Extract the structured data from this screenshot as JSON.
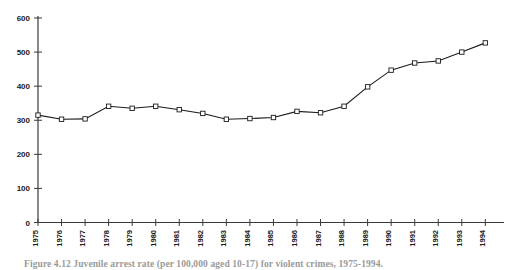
{
  "figure": {
    "caption": "Figure 4.12  Juvenile arrest rate (per 100,000 aged 10-17) for violent crimes, 1975-1994."
  },
  "chart_data": {
    "type": "line",
    "title": "",
    "xlabel": "",
    "ylabel": "",
    "categories": [
      "1975",
      "1976",
      "1977",
      "1978",
      "1979",
      "1980",
      "1981",
      "1982",
      "1983",
      "1984",
      "1985",
      "1986",
      "1987",
      "1988",
      "1989",
      "1990",
      "1991",
      "1992",
      "1993",
      "1994"
    ],
    "values": [
      315,
      303,
      304,
      341,
      335,
      341,
      331,
      320,
      303,
      305,
      308,
      326,
      322,
      341,
      398,
      447,
      468,
      474,
      500,
      527
    ],
    "ylim": [
      0,
      600
    ],
    "yticks": [
      0,
      100,
      200,
      300,
      400,
      500,
      600
    ],
    "ytick_labels": [
      "0",
      "100",
      "200",
      "300",
      "400",
      "500",
      "600"
    ],
    "grid": false,
    "legend": false,
    "marker": "open-square",
    "line_color": "#1a1a1a",
    "marker_face_color": "#ffffff"
  }
}
